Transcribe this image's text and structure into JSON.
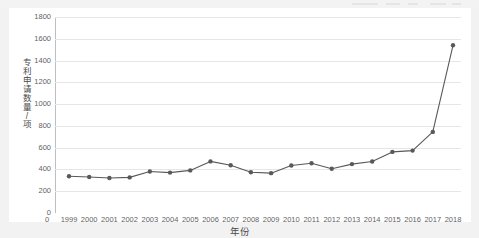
{
  "figure": {
    "background_color": "#f2f2f2",
    "card_color": "#ffffff",
    "series_color": "#595959",
    "grid_color": "#e6e6e6",
    "axis_color": "#bfbfbf"
  },
  "chart_data": {
    "type": "line",
    "title": "",
    "xlabel": "年份",
    "ylabel": "专利申请数量/项",
    "categories": [
      "1999",
      "2000",
      "2001",
      "2002",
      "2003",
      "2004",
      "2005",
      "2006",
      "2007",
      "2008",
      "2009",
      "2010",
      "2011",
      "2012",
      "2013",
      "2014",
      "2015",
      "2016",
      "2017",
      "2018"
    ],
    "values": [
      338,
      330,
      322,
      327,
      381,
      371,
      391,
      474,
      439,
      374,
      366,
      436,
      457,
      407,
      449,
      473,
      561,
      573,
      745,
      1540
    ],
    "series": [
      {
        "name": "专利申请数量",
        "values": [
          338,
          330,
          322,
          327,
          381,
          371,
          391,
          474,
          439,
          374,
          366,
          436,
          457,
          407,
          449,
          473,
          561,
          573,
          745,
          1540
        ]
      }
    ],
    "ylim": [
      0,
      1800
    ],
    "yticks": [
      0,
      200,
      400,
      600,
      800,
      1000,
      1200,
      1400,
      1600,
      1800
    ],
    "ytick_labels": [
      "0",
      "200",
      "400",
      "600",
      "800",
      "1000",
      "1200",
      "1400",
      "1600",
      "1800"
    ],
    "xtick_labels": [
      "0",
      "1999",
      "2000",
      "2001",
      "2002",
      "2003",
      "2004",
      "2005",
      "2006",
      "2007",
      "2008",
      "2009",
      "2010",
      "2011",
      "2012",
      "2013",
      "2014",
      "2015",
      "2016",
      "2017",
      "2018"
    ],
    "grid": true,
    "grid_axis": "y",
    "legend": false,
    "legend_position": "none",
    "marker": "circle",
    "line_width": 1
  },
  "y_axis_title_chars": [
    "专",
    "利",
    "申",
    "请",
    "数",
    "量",
    "/",
    "项"
  ]
}
